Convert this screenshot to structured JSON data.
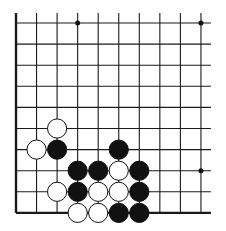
{
  "board": {
    "title": "Go board fragment (lower-left corner)",
    "columns": 10,
    "rows": 10,
    "origin_x": 16,
    "origin_y": 23,
    "spacing_x": 20.55,
    "spacing_y": 21.1,
    "line_color": "#1a1a1a",
    "edges": {
      "left": true,
      "bottom": true,
      "top": false,
      "right": false
    },
    "star_points": [
      [
        3,
        0
      ],
      [
        9,
        0
      ],
      [
        9,
        7
      ]
    ],
    "stones": [
      {
        "color": "white",
        "col": 2,
        "row": 5
      },
      {
        "color": "white",
        "col": 1,
        "row": 6
      },
      {
        "color": "black",
        "col": 2,
        "row": 6
      },
      {
        "color": "black",
        "col": 5,
        "row": 6
      },
      {
        "color": "black",
        "col": 3,
        "row": 7
      },
      {
        "color": "black",
        "col": 4,
        "row": 7
      },
      {
        "color": "white",
        "col": 5,
        "row": 7
      },
      {
        "color": "black",
        "col": 6,
        "row": 7
      },
      {
        "color": "white",
        "col": 2,
        "row": 8
      },
      {
        "color": "black",
        "col": 3,
        "row": 8
      },
      {
        "color": "white",
        "col": 4,
        "row": 8
      },
      {
        "color": "white",
        "col": 5,
        "row": 8
      },
      {
        "color": "black",
        "col": 6,
        "row": 8
      },
      {
        "color": "white",
        "col": 3,
        "row": 9
      },
      {
        "color": "white",
        "col": 4,
        "row": 9
      },
      {
        "color": "black",
        "col": 5,
        "row": 9
      },
      {
        "color": "black",
        "col": 6,
        "row": 9
      }
    ]
  }
}
